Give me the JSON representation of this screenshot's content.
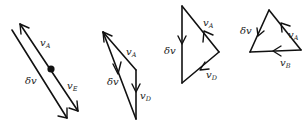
{
  "diagram": {
    "stroke_color": "#111111",
    "background": "#ffffff",
    "figures": [
      {
        "id": "fig1",
        "labels": {
          "vA": {
            "base": "v",
            "sub": "A"
          },
          "dv": {
            "base": "δv",
            "sub": ""
          },
          "vE": {
            "base": "v",
            "sub": "E"
          }
        },
        "has_point": true
      },
      {
        "id": "fig2",
        "labels": {
          "vA": {
            "base": "v",
            "sub": "A"
          },
          "dv": {
            "base": "δv",
            "sub": ""
          },
          "vD": {
            "base": "v",
            "sub": "D"
          }
        }
      },
      {
        "id": "fig3",
        "labels": {
          "vA": {
            "base": "v",
            "sub": "A"
          },
          "dv": {
            "base": "δv",
            "sub": ""
          },
          "vD": {
            "base": "v",
            "sub": "D"
          }
        }
      },
      {
        "id": "fig4",
        "labels": {
          "vA": {
            "base": "v",
            "sub": "A"
          },
          "dv": {
            "base": "δv",
            "sub": ""
          },
          "vB": {
            "base": "v",
            "sub": "B"
          }
        }
      }
    ]
  }
}
